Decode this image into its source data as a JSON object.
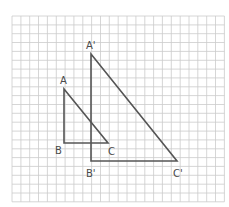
{
  "diagram": {
    "type": "similar-triangles-on-grid",
    "grid": {
      "origin_px": [
        12,
        16
      ],
      "cell_px": 8.85,
      "cols": 24,
      "rows": 21,
      "line_color": "#cccccc"
    },
    "stroke_color": "#555555",
    "label_color": "#4a4a4a",
    "triangles": [
      {
        "name": "ABC",
        "vertices": {
          "A": {
            "x": 64,
            "y": 89,
            "label": "A",
            "label_pos": [
              60,
              84
            ]
          },
          "B": {
            "x": 64,
            "y": 143,
            "label": "B",
            "label_pos": [
              55,
              154
            ]
          },
          "C": {
            "x": 108,
            "y": 143,
            "label": "C",
            "label_pos": [
              108,
              155
            ]
          }
        }
      },
      {
        "name": "A'B'C'",
        "vertices": {
          "A": {
            "x": 91,
            "y": 54,
            "label": "A'",
            "label_pos": [
              86,
              49
            ]
          },
          "B": {
            "x": 91,
            "y": 161,
            "label": "B'",
            "label_pos": [
              86,
              177
            ]
          },
          "C": {
            "x": 177,
            "y": 161,
            "label": "C'",
            "label_pos": [
              173,
              177
            ]
          }
        }
      }
    ]
  },
  "labels": {
    "A": "A",
    "B": "B",
    "C": "C",
    "A_prime": "A'",
    "B_prime": "B'",
    "C_prime": "C'"
  }
}
